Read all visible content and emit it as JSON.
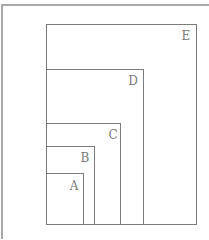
{
  "diagram": {
    "type": "nested-rectangles",
    "stroke_color": "#7b7b7b",
    "label_color": "#7a7a7a",
    "frame_color": "#a9a9a9",
    "boxes": [
      {
        "label": "E",
        "x": 46,
        "y": 24,
        "w": 151,
        "h": 201,
        "lx": 186,
        "ly": 36
      },
      {
        "label": "D",
        "x": 46,
        "y": 69,
        "w": 98,
        "h": 156,
        "lx": 133,
        "ly": 81
      },
      {
        "label": "C",
        "x": 46,
        "y": 123,
        "w": 75,
        "h": 102,
        "lx": 113,
        "ly": 135
      },
      {
        "label": "B",
        "x": 46,
        "y": 146,
        "w": 49,
        "h": 79,
        "lx": 85,
        "ly": 158
      },
      {
        "label": "A",
        "x": 46,
        "y": 173,
        "w": 38,
        "h": 52,
        "lx": 74,
        "ly": 186
      }
    ]
  }
}
